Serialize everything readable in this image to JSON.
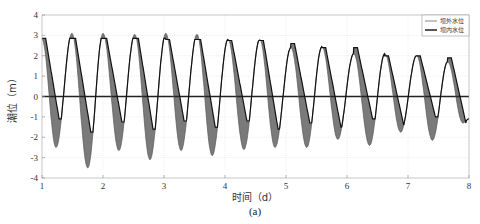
{
  "chart_data": {
    "type": "line",
    "title": "",
    "caption": "(a)",
    "xlabel": "时间（d）",
    "ylabel": "潮位（m）",
    "xlim": [
      1,
      8
    ],
    "ylim": [
      -4,
      4
    ],
    "xticks": [
      1,
      2,
      3,
      4,
      5,
      6,
      7,
      8
    ],
    "yticks": [
      -4,
      -3,
      -2,
      -1,
      0,
      1,
      2,
      3,
      4
    ],
    "grid": true,
    "legend_position": "top-right",
    "legend": [
      "坝外水位",
      "坝内水位"
    ],
    "series": [
      {
        "name": "坝外水位",
        "style": "thin-line",
        "extrema": {
          "x": [
            1.0,
            1.23,
            1.49,
            1.75,
            2.0,
            2.26,
            2.52,
            2.77,
            3.03,
            3.28,
            3.54,
            3.79,
            4.05,
            4.31,
            4.57,
            4.82,
            5.08,
            5.34,
            5.59,
            5.85,
            6.11,
            6.37,
            6.62,
            6.88,
            7.14,
            7.4,
            7.65,
            7.9,
            8.0
          ],
          "y": [
            2.8,
            -2.5,
            3.1,
            -3.5,
            3.1,
            -2.65,
            3.05,
            -3.1,
            3.1,
            -2.65,
            3.05,
            -2.9,
            2.8,
            -2.6,
            2.8,
            -2.5,
            2.4,
            -2.5,
            2.45,
            -2.1,
            2.1,
            -2.4,
            2.1,
            -1.75,
            2.0,
            -2.15,
            1.7,
            -1.3,
            -1.1
          ]
        }
      },
      {
        "name": "坝内水位",
        "style": "thick-line",
        "flat_top": [
          2.85,
          2.85,
          2.85,
          2.85,
          2.8,
          2.8,
          2.75,
          2.75,
          2.6,
          2.4,
          2.4,
          2.0,
          2.0,
          1.9,
          1.6
        ],
        "trough": [
          -1.1,
          -1.75,
          -1.25,
          -1.6,
          -1.2,
          -1.5,
          -1.2,
          -1.6,
          -1.3,
          -1.5,
          -1.1,
          -1.4,
          -1.0,
          -1.3,
          -1.0
        ]
      },
      {
        "name": "zero-level",
        "style": "thick-horizontal",
        "value": 0
      }
    ],
    "colors": {
      "outer_line": "#555555",
      "inner_line": "#111111",
      "fill": "#7a7a7a",
      "grid": "#e2e2e2",
      "axis": "#888888"
    }
  }
}
